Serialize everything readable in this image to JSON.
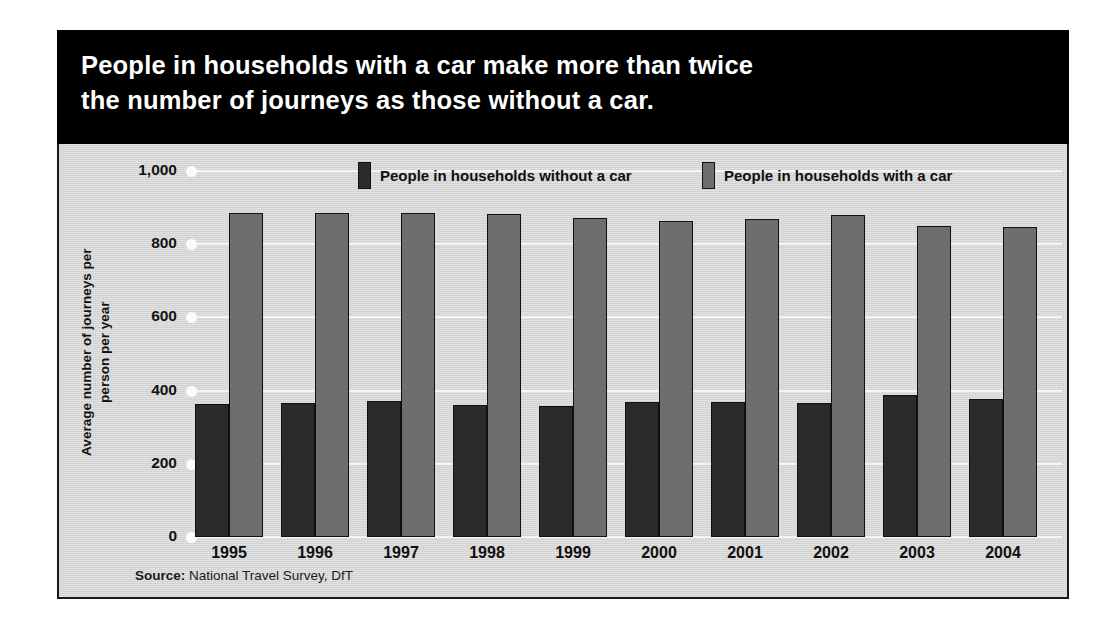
{
  "title": "People in households with a car make more than twice\nthe number of journeys as those without a car.",
  "source": {
    "lead": "Source:",
    "text": " National Travel Survey, DfT"
  },
  "colors": {
    "banner_bg": "#000000",
    "banner_text": "#ffffff",
    "panel_bg": "#d7d7d7",
    "series_without_car": "#2b2b2b",
    "series_with_car": "#6e6e6e",
    "gridline": "#f4f4f4"
  },
  "chart_data": {
    "type": "bar",
    "title": "People in households with a car make more than twice the number of journeys as those without a car.",
    "xlabel": "",
    "ylabel": "Average number of journeys per\nperson per year",
    "ylim": [
      0,
      1000
    ],
    "yticks": [
      0,
      200,
      400,
      600,
      800,
      1000
    ],
    "ytick_labels": [
      "0",
      "200",
      "400",
      "600",
      "800",
      "1,000"
    ],
    "grid": true,
    "legend_position": "top",
    "categories": [
      "1995",
      "1996",
      "1997",
      "1998",
      "1999",
      "2000",
      "2001",
      "2002",
      "2003",
      "2004"
    ],
    "series": [
      {
        "name": "People in households without a car",
        "color": "#2b2b2b",
        "values": [
          363,
          366,
          371,
          362,
          359,
          370,
          369,
          367,
          388,
          377
        ]
      },
      {
        "name": "People in households with a car",
        "color": "#6e6e6e",
        "values": [
          884,
          885,
          884,
          883,
          872,
          864,
          869,
          880,
          851,
          847
        ]
      }
    ]
  }
}
